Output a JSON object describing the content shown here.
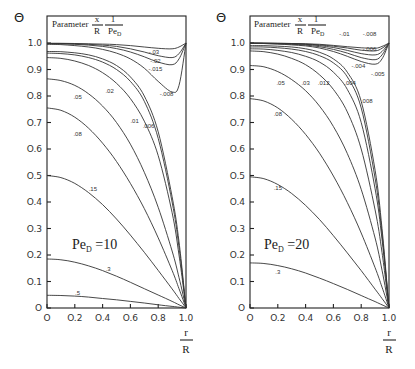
{
  "figure": {
    "parameter_label": "Parameter",
    "parameter_num": "x",
    "parameter_den": "R",
    "parameter_num2": "1",
    "parameter_den2": "Pe",
    "parameter_den2_sub": "D",
    "y_symbol": "Θ",
    "x_num": "r",
    "x_den": "R"
  },
  "chart_data": [
    {
      "type": "line",
      "title": "Pe_D = 10",
      "annotation": "Pe_D = 10",
      "xlabel": "r/R",
      "ylabel": "Θ",
      "xlim": [
        0,
        1.0
      ],
      "ylim": [
        0,
        1.05
      ],
      "xticks": [
        "0",
        "0.2",
        "0.4",
        "0.6",
        "0.8",
        "1.0"
      ],
      "yticks": [
        "0",
        "0.1",
        "0.2",
        "0.3",
        "0.4",
        "0.5",
        "0.6",
        "0.7",
        "0.8",
        "0.9",
        "1.0"
      ],
      "legend_title": "Parameter x/R · 1/Pe_D",
      "frame": {
        "x0": 47,
        "x1": 186,
        "y0": 308,
        "y1": 43,
        "top": 16,
        "right": 186
      },
      "x": [
        0,
        0.1,
        0.2,
        0.3,
        0.4,
        0.5,
        0.6,
        0.7,
        0.8,
        0.9,
        0.95,
        1.0
      ],
      "series": [
        {
          "name": "-.03",
          "label": "-.03",
          "lx": 0.77,
          "ly": 0.96,
          "values": [
            0.999,
            0.999,
            0.998,
            0.997,
            0.996,
            0.994,
            0.99,
            0.985,
            0.98,
            0.978,
            0.985,
            1.0
          ]
        },
        {
          "name": "-.02",
          "label": "-.02",
          "lx": 0.78,
          "ly": 0.925,
          "values": [
            0.998,
            0.998,
            0.997,
            0.995,
            0.992,
            0.987,
            0.978,
            0.966,
            0.952,
            0.945,
            0.96,
            1.0
          ]
        },
        {
          "name": "-.015",
          "label": "-.015",
          "lx": 0.78,
          "ly": 0.895,
          "values": [
            0.997,
            0.997,
            0.995,
            0.992,
            0.987,
            0.979,
            0.966,
            0.948,
            0.928,
            0.918,
            0.94,
            1.0
          ]
        },
        {
          "name": "-.008",
          "label": "-.008",
          "lx": 0.86,
          "ly": 0.8,
          "values": [
            0.995,
            0.994,
            0.99,
            0.985,
            0.976,
            0.962,
            0.94,
            0.905,
            0.855,
            0.815,
            0.84,
            1.0
          ]
        },
        {
          "name": ".006",
          "label": ".006",
          "lx": 0.73,
          "ly": 0.68,
          "values": [
            0.968,
            0.967,
            0.963,
            0.955,
            0.94,
            0.915,
            0.872,
            0.8,
            0.665,
            0.42,
            0.25,
            0.0
          ]
        },
        {
          "name": ".01",
          "label": ".01",
          "lx": 0.63,
          "ly": 0.7,
          "values": [
            0.962,
            0.96,
            0.955,
            0.945,
            0.928,
            0.9,
            0.855,
            0.78,
            0.64,
            0.4,
            0.23,
            0.0
          ]
        },
        {
          "name": ".02",
          "label": ".02",
          "lx": 0.45,
          "ly": 0.81,
          "values": [
            0.945,
            0.942,
            0.932,
            0.915,
            0.888,
            0.848,
            0.79,
            0.705,
            0.575,
            0.36,
            0.2,
            0.0
          ]
        },
        {
          "name": ".05",
          "label": ".05",
          "lx": 0.22,
          "ly": 0.79,
          "values": [
            0.865,
            0.858,
            0.84,
            0.808,
            0.762,
            0.7,
            0.618,
            0.512,
            0.38,
            0.215,
            0.115,
            0.0
          ]
        },
        {
          "name": ".08",
          "label": ".08",
          "lx": 0.22,
          "ly": 0.65,
          "values": [
            0.755,
            0.746,
            0.72,
            0.678,
            0.622,
            0.553,
            0.47,
            0.375,
            0.265,
            0.142,
            0.073,
            0.0
          ]
        },
        {
          "name": ".15",
          "label": ".15",
          "lx": 0.33,
          "ly": 0.44,
          "values": [
            0.5,
            0.492,
            0.47,
            0.435,
            0.39,
            0.336,
            0.275,
            0.21,
            0.142,
            0.072,
            0.036,
            0.0
          ]
        },
        {
          "name": ".3",
          "label": ".3",
          "lx": 0.44,
          "ly": 0.14,
          "values": [
            0.185,
            0.182,
            0.173,
            0.159,
            0.141,
            0.12,
            0.097,
            0.073,
            0.049,
            0.025,
            0.012,
            0.0
          ]
        },
        {
          "name": ".5",
          "label": ".5",
          "lx": 0.22,
          "ly": 0.05,
          "values": [
            0.048,
            0.047,
            0.045,
            0.041,
            0.036,
            0.031,
            0.025,
            0.019,
            0.012,
            0.006,
            0.003,
            0.0
          ]
        }
      ]
    },
    {
      "type": "line",
      "title": "Pe_D = 20",
      "annotation": "Pe_D = 20",
      "xlabel": "r/R",
      "ylabel": "Θ",
      "xlim": [
        0,
        1.0
      ],
      "ylim": [
        0,
        1.05
      ],
      "xticks": [
        "0",
        "0.2",
        "0.4",
        "0.6",
        "0.8",
        "1.0"
      ],
      "yticks": [
        "0",
        "0.1",
        "0.2",
        "0.3",
        "0.4",
        "0.5",
        "0.6",
        "0.7",
        "0.8",
        "0.9",
        "1.0"
      ],
      "legend_title": "Parameter x/R · 1/Pe_D",
      "frame": {
        "x0": 250,
        "x1": 389,
        "y0": 308,
        "y1": 43,
        "top": 16,
        "right": 389
      },
      "x": [
        0,
        0.1,
        0.2,
        0.3,
        0.4,
        0.5,
        0.6,
        0.7,
        0.8,
        0.9,
        0.95,
        1.0
      ],
      "series": [
        {
          "name": "-.01",
          "label": "-.01",
          "lx": 0.68,
          "ly": 1.025,
          "values": [
            1.0,
            1.0,
            0.999,
            0.998,
            0.997,
            0.995,
            0.991,
            0.986,
            0.982,
            0.98,
            0.987,
            1.0
          ]
        },
        {
          "name": "-.008",
          "label": "-.008",
          "lx": 0.86,
          "ly": 1.025,
          "values": [
            1.0,
            0.999,
            0.999,
            0.998,
            0.996,
            0.993,
            0.988,
            0.981,
            0.973,
            0.97,
            0.98,
            1.0
          ]
        },
        {
          "name": "-.006",
          "label": "-.006",
          "lx": 0.86,
          "ly": 0.97,
          "values": [
            0.999,
            0.999,
            0.998,
            0.997,
            0.995,
            0.99,
            0.983,
            0.972,
            0.96,
            0.955,
            0.968,
            1.0
          ]
        },
        {
          "name": "-.005",
          "label": "-.005",
          "lx": 0.92,
          "ly": 0.875,
          "values": [
            0.999,
            0.998,
            0.997,
            0.995,
            0.992,
            0.986,
            0.976,
            0.962,
            0.945,
            0.937,
            0.955,
            1.0
          ]
        },
        {
          "name": "-.004",
          "label": "-.004",
          "lx": 0.78,
          "ly": 0.905,
          "values": [
            0.998,
            0.998,
            0.996,
            0.993,
            0.989,
            0.981,
            0.968,
            0.95,
            0.93,
            0.92,
            0.94,
            1.0
          ]
        },
        {
          "name": ".004",
          "label": ".004",
          "lx": 0.72,
          "ly": 0.84,
          "values": [
            0.99,
            0.99,
            0.988,
            0.985,
            0.978,
            0.965,
            0.94,
            0.89,
            0.78,
            0.52,
            0.3,
            0.0
          ]
        },
        {
          "name": ".008",
          "label": ".008",
          "lx": 0.84,
          "ly": 0.775,
          "values": [
            0.985,
            0.985,
            0.982,
            0.977,
            0.968,
            0.952,
            0.925,
            0.872,
            0.755,
            0.49,
            0.28,
            0.0
          ]
        },
        {
          "name": ".012",
          "label": ".012",
          "lx": 0.53,
          "ly": 0.84,
          "values": [
            0.978,
            0.977,
            0.972,
            0.964,
            0.95,
            0.928,
            0.89,
            0.825,
            0.7,
            0.45,
            0.26,
            0.0
          ]
        },
        {
          "name": ".03",
          "label": ".03",
          "lx": 0.4,
          "ly": 0.84,
          "values": [
            0.97,
            0.967,
            0.958,
            0.942,
            0.918,
            0.88,
            0.825,
            0.74,
            0.6,
            0.37,
            0.21,
            0.0
          ]
        },
        {
          "name": ".05",
          "label": ".05",
          "lx": 0.22,
          "ly": 0.84,
          "values": [
            0.915,
            0.91,
            0.892,
            0.862,
            0.82,
            0.762,
            0.685,
            0.583,
            0.448,
            0.264,
            0.143,
            0.0
          ]
        },
        {
          "name": ".08",
          "label": ".08",
          "lx": 0.2,
          "ly": 0.725,
          "values": [
            0.79,
            0.781,
            0.755,
            0.712,
            0.655,
            0.584,
            0.498,
            0.398,
            0.283,
            0.152,
            0.079,
            0.0
          ]
        },
        {
          "name": ".15",
          "label": ".15",
          "lx": 0.2,
          "ly": 0.445,
          "values": [
            0.495,
            0.488,
            0.466,
            0.432,
            0.387,
            0.334,
            0.273,
            0.208,
            0.141,
            0.071,
            0.036,
            0.0
          ]
        },
        {
          "name": ".3",
          "label": ".3",
          "lx": 0.2,
          "ly": 0.13,
          "values": [
            0.17,
            0.168,
            0.16,
            0.148,
            0.132,
            0.113,
            0.092,
            0.07,
            0.047,
            0.024,
            0.012,
            0.0
          ]
        }
      ]
    }
  ]
}
